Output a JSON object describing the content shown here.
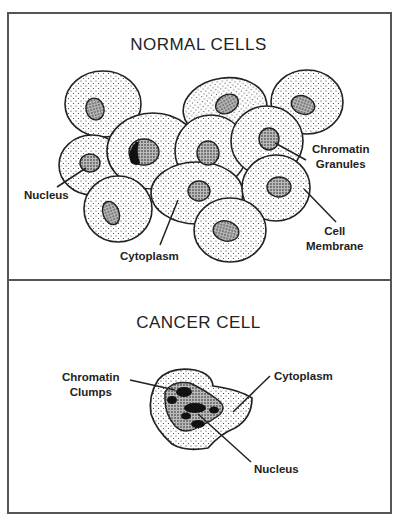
{
  "sections": {
    "normal": {
      "title": "NORMAL CELLS",
      "labels": {
        "nucleus": "Nucleus",
        "chromatin_line1": "Chromatin",
        "chromatin_line2": "Granules",
        "cytoplasm": "Cytoplasm",
        "membrane_line1": "Cell",
        "membrane_line2": "Membrane"
      }
    },
    "cancer": {
      "title": "CANCER CELL",
      "labels": {
        "chromatin_line1": "Chromatin",
        "chromatin_line2": "Clumps",
        "cytoplasm": "Cytoplasm",
        "nucleus": "Nucleus"
      }
    }
  },
  "colors": {
    "outline": "#222222",
    "frame": "#555555",
    "nucleus_fill": "#6a6a6a",
    "clump_fill": "#111111"
  }
}
